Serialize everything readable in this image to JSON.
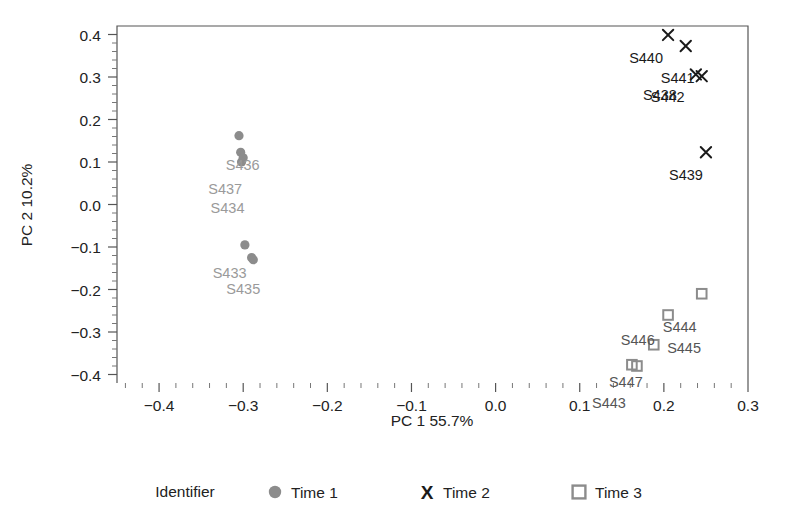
{
  "chart_data": {
    "type": "scatter",
    "title": "",
    "xlabel": "PC 1 55.7%",
    "ylabel": "PC 2 10.2%",
    "xlim": [
      -0.45,
      0.3
    ],
    "ylim": [
      -0.42,
      0.42
    ],
    "xticks": [
      "-0.4",
      "-0.3",
      "-0.2",
      "-0.1",
      "0.0",
      "0.1",
      "0.2",
      "0.3"
    ],
    "xtick_values": [
      -0.4,
      -0.3,
      -0.2,
      -0.1,
      0.0,
      0.1,
      0.2,
      0.3
    ],
    "yticks": [
      "0.4",
      "0.3",
      "0.2",
      "0.1",
      "0.0",
      "-0.1",
      "-0.2",
      "-0.3",
      "-0.4"
    ],
    "ytick_values": [
      0.4,
      0.3,
      0.2,
      0.1,
      0.0,
      -0.1,
      -0.2,
      -0.3,
      -0.4
    ],
    "grid": false,
    "minor_ticks_per_interval": 5,
    "legend": {
      "position": "bottom",
      "title": "Identifier",
      "entries": [
        {
          "label": "Time 1",
          "marker": "circle",
          "color": "#8c8c8c"
        },
        {
          "label": "Time 2",
          "marker": "x",
          "color": "#1a1a1a"
        },
        {
          "label": "Time 3",
          "marker": "square",
          "color": "#8c8c8c"
        }
      ]
    },
    "series": [
      {
        "name": "Time 1",
        "marker": "circle",
        "color": "#8c8c8c",
        "points": [
          {
            "id": "",
            "x": -0.305,
            "y": 0.162,
            "label": "",
            "label_dx": 0,
            "label_dy": 0
          },
          {
            "id": "S436",
            "x": -0.303,
            "y": 0.123,
            "label": "S436",
            "label_dx": 2,
            "label_dy": 18
          },
          {
            "id": "S437",
            "x": -0.3,
            "y": 0.11,
            "label": "S437",
            "label_dx": -18,
            "label_dy": 36
          },
          {
            "id": "S434",
            "x": -0.302,
            "y": 0.1,
            "label": "S434",
            "label_dx": -14,
            "label_dy": 51
          },
          {
            "id": "",
            "x": -0.298,
            "y": -0.095,
            "label": "",
            "label_dx": 0,
            "label_dy": 0
          },
          {
            "id": "S433",
            "x": -0.29,
            "y": -0.125,
            "label": "S433",
            "label_dx": -22,
            "label_dy": 20
          },
          {
            "id": "S435",
            "x": -0.288,
            "y": -0.13,
            "label": "S435",
            "label_dx": -10,
            "label_dy": 34
          }
        ]
      },
      {
        "name": "Time 2",
        "marker": "x",
        "color": "#1a1a1a",
        "points": [
          {
            "id": "S440",
            "x": 0.205,
            "y": 0.399,
            "label": "S440",
            "label_dx": -22,
            "label_dy": 28
          },
          {
            "id": "S441",
            "x": 0.226,
            "y": 0.373,
            "label": "S441",
            "label_dx": -8,
            "label_dy": 37
          },
          {
            "id": "S438",
            "x": 0.238,
            "y": 0.306,
            "label": "S438",
            "label_dx": -36,
            "label_dy": 26
          },
          {
            "id": "S442",
            "x": 0.245,
            "y": 0.302,
            "label": "S442",
            "label_dx": -34,
            "label_dy": 26
          },
          {
            "id": "S439",
            "x": 0.25,
            "y": 0.123,
            "label": "S439",
            "label_dx": -20,
            "label_dy": 28
          }
        ]
      },
      {
        "name": "Time 3",
        "marker": "square",
        "color": "#8c8c8c",
        "points": [
          {
            "id": "S444",
            "x": 0.245,
            "y": -0.21,
            "label": "S444",
            "label_dx": -22,
            "label_dy": 38
          },
          {
            "id": "S445",
            "x": 0.205,
            "y": -0.26,
            "label": "S445",
            "label_dx": 16,
            "label_dy": 38
          },
          {
            "id": "S446",
            "x": 0.188,
            "y": -0.33,
            "label": "S446",
            "label_dx": -16,
            "label_dy": 0
          },
          {
            "id": "S447",
            "x": 0.162,
            "y": -0.377,
            "label": "S447",
            "label_dx": -6,
            "label_dy": 22
          },
          {
            "id": "S443",
            "x": 0.168,
            "y": -0.38,
            "label": "S443",
            "label_dx": -28,
            "label_dy": 42
          }
        ]
      }
    ]
  },
  "plot_area": {
    "left": 117,
    "right": 748,
    "top": 26,
    "bottom": 383
  },
  "figure": {
    "width": 789,
    "height": 526,
    "background": "#ffffff"
  }
}
